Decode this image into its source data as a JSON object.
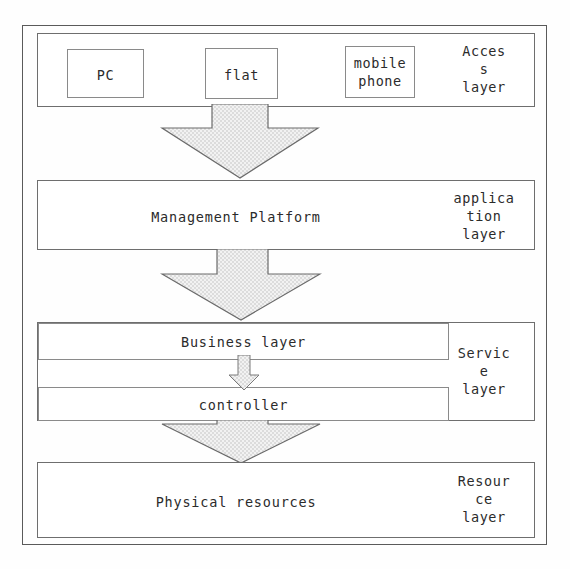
{
  "diagram": {
    "background_color": "#fefefe",
    "line_color": "#6e6e6e",
    "arrow_fill_color": "#e8e8e8",
    "text_color": "#2b2b2b",
    "layers": [
      {
        "id": "access",
        "side_label": "Acces\ns\nlayer",
        "side_label_lines": [
          "Acces",
          "s",
          "layer"
        ],
        "devices": [
          {
            "id": "pc",
            "label": "PC"
          },
          {
            "id": "flat",
            "label": "flat"
          },
          {
            "id": "mobile-phone",
            "label": "mobile\nphone",
            "lines": [
              "mobile",
              "phone"
            ]
          }
        ]
      },
      {
        "id": "application",
        "side_label_lines": [
          "applica",
          "tion",
          "layer"
        ],
        "main_label": "Management Platform"
      },
      {
        "id": "service",
        "side_label_lines": [
          "Servic",
          "e",
          "layer"
        ],
        "sub_boxes": [
          {
            "id": "business-layer",
            "label": "Business layer"
          },
          {
            "id": "controller",
            "label": "controller"
          }
        ]
      },
      {
        "id": "resource",
        "side_label_lines": [
          "Resour",
          "ce",
          "layer"
        ],
        "main_label": "Physical resources"
      }
    ],
    "arrows": [
      {
        "id": "access-to-application",
        "direction": "down",
        "size": "large"
      },
      {
        "id": "application-to-service",
        "direction": "down",
        "size": "large"
      },
      {
        "id": "business-to-controller",
        "direction": "down",
        "size": "small"
      },
      {
        "id": "service-to-resource",
        "direction": "down",
        "size": "large"
      }
    ]
  }
}
